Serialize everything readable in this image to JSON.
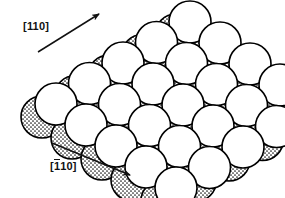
{
  "figure": {
    "kind": "crystal-surface-hard-sphere-model",
    "background_color": "#ffffff",
    "width": 285,
    "height": 198
  },
  "annotations": {
    "direction_top": {
      "name": "direction-110",
      "bracket_open": "[",
      "index_1": "1",
      "index_2": "1",
      "index_3": "0",
      "bracket_close": "]",
      "overbar_on_first": false,
      "arrow_from": [
        38,
        52
      ],
      "arrow_to": [
        99,
        14
      ],
      "arrow_color": "#111111"
    },
    "direction_bottom": {
      "name": "direction-1bar10",
      "bracket_open": "[",
      "index_1": "1",
      "index_2": "1",
      "index_3": "0",
      "bracket_close": "]",
      "overbar_on_first": true,
      "arrow_from": [
        52,
        143
      ],
      "arrow_to": [
        130,
        175
      ],
      "arrow_color": "#111111"
    }
  },
  "legend_species": [
    {
      "id": "white",
      "label": "top-layer atom",
      "fill": "#ffffff",
      "stroke": "#000000",
      "radius": 21
    },
    {
      "id": "stippled",
      "label": "second-layer atom",
      "fill": "#d8d8d8",
      "stroke": "#000000",
      "radius": 21
    },
    {
      "id": "black",
      "label": "interstitial/adsorbate",
      "fill": "#000000",
      "stroke": "#000000",
      "radius": 9
    }
  ],
  "lattice": {
    "origin": [
      56,
      104
    ],
    "vector_a": [
      33.5,
      -20.5
    ],
    "vector_b": [
      30.0,
      21.0
    ],
    "rows": 5,
    "cols": 5,
    "black_offset": [
      -9,
      4
    ],
    "stipple_offset": [
      -14,
      13
    ],
    "render_order": [
      "stippled",
      "black",
      "white"
    ]
  },
  "chart_data": {
    "type": "scatter",
    "title": "",
    "xlabel": "",
    "ylabel": "",
    "note": "Hard-sphere packing model of an fcc(110)-type surface; spheres placed on a 2D oblique lattice.",
    "series": [
      {
        "name": "second-layer (stippled)",
        "n": 25
      },
      {
        "name": "interstitial (black)",
        "n": 25
      },
      {
        "name": "top-layer (white)",
        "n": 25
      }
    ]
  }
}
